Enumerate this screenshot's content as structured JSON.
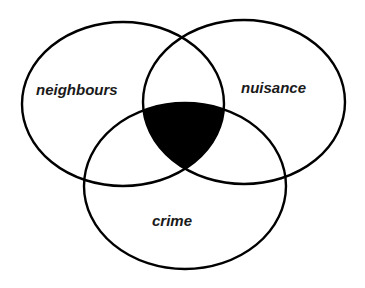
{
  "diagram": {
    "type": "venn-3",
    "sets": [
      {
        "id": "neighbours",
        "label": "neighbours"
      },
      {
        "id": "nuisance",
        "label": "nuisance"
      },
      {
        "id": "crime",
        "label": "crime"
      }
    ],
    "highlighted_region": "neighbours ∩ nuisance ∩ crime",
    "colors": {
      "stroke": "#000000",
      "fill_highlight": "#000000",
      "background": "#ffffff"
    }
  }
}
